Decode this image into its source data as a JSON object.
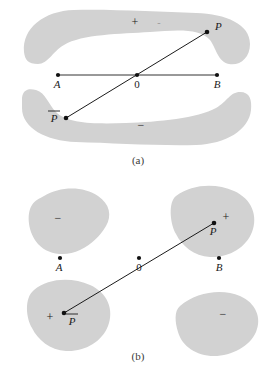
{
  "figure": {
    "background_color": "#ffffff",
    "region_fill": "#d2d2d2",
    "line_color": "#1b1b1b",
    "point_color": "#111111"
  },
  "panel_a": {
    "caption": "(a)",
    "regions": [
      {
        "name": "upper-crescent",
        "sign_label": "+"
      },
      {
        "name": "upper-crescent-secondary",
        "sign_label": "-"
      },
      {
        "name": "lower-crescent",
        "sign_label": "−"
      }
    ],
    "points": [
      {
        "id": "A",
        "label": "A",
        "x": 58,
        "y": 75
      },
      {
        "id": "O",
        "label": "0",
        "x": 137,
        "y": 75
      },
      {
        "id": "B",
        "label": "B",
        "x": 217,
        "y": 75
      },
      {
        "id": "P",
        "label": "P",
        "x": 207,
        "y": 32
      },
      {
        "id": "Pbar",
        "label": "P",
        "overbar": true,
        "x": 66,
        "y": 118
      }
    ],
    "segments": [
      {
        "name": "axis-segment-A-B",
        "from": "A",
        "to": "B"
      },
      {
        "name": "antipodal-segment-Pbar-P",
        "from": "Pbar",
        "to": "P"
      }
    ]
  },
  "panel_b": {
    "caption": "(b)",
    "regions": [
      {
        "name": "top-left-blob",
        "sign_label": "−"
      },
      {
        "name": "top-right-blob",
        "sign_label": "+"
      },
      {
        "name": "bottom-left-blob",
        "sign_label": "+"
      },
      {
        "name": "bottom-right-blob",
        "sign_label": "−"
      }
    ],
    "points": [
      {
        "id": "A",
        "label": "A",
        "x": 60,
        "y": 258
      },
      {
        "id": "O",
        "label": "0",
        "x": 139,
        "y": 258
      },
      {
        "id": "B",
        "label": "B",
        "x": 219,
        "y": 258
      },
      {
        "id": "P",
        "label": "P",
        "x": 214,
        "y": 223
      },
      {
        "id": "Pbar",
        "label": "P",
        "overbar": true,
        "x": 64,
        "y": 313
      }
    ],
    "segments": [
      {
        "name": "antipodal-segment-Pbar-P",
        "from": "Pbar",
        "to": "P"
      }
    ]
  }
}
